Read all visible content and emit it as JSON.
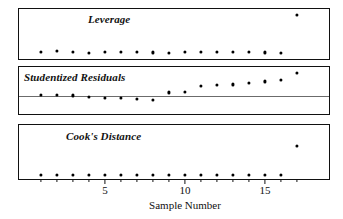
{
  "chart_data": {
    "type": "scatter",
    "title": "",
    "xlabel": "Sample Number",
    "ylabel": "",
    "xlim": [
      0.2,
      17.8
    ],
    "xticks": [
      5,
      10,
      15
    ],
    "xticklabels": [
      "5",
      "10",
      "15"
    ],
    "grid": false,
    "legend": "none",
    "panels": [
      {
        "label": "Leverage",
        "ylim": [
          0,
          1
        ],
        "zero_line": false,
        "x": [
          1,
          2,
          3,
          4,
          5,
          6,
          7,
          8,
          9,
          10,
          11,
          12,
          13,
          14,
          15,
          16,
          17
        ],
        "values": [
          0.1,
          0.11,
          0.09,
          0.07,
          0.09,
          0.09,
          0.09,
          0.08,
          0.07,
          0.1,
          0.1,
          0.1,
          0.1,
          0.09,
          0.08,
          0.07,
          0.93
        ]
      },
      {
        "label": "Studentized Residuals",
        "ylim": [
          -1,
          1
        ],
        "zero_line": true,
        "x": [
          1,
          2,
          3,
          4,
          5,
          6,
          7,
          8,
          9,
          10,
          11,
          12,
          13,
          14,
          15,
          16,
          17
        ],
        "values": [
          -0.22,
          -0.2,
          -0.24,
          -0.33,
          -0.38,
          -0.38,
          -0.4,
          -0.44,
          -0.09,
          -0.07,
          0.22,
          0.26,
          0.3,
          0.36,
          0.44,
          0.5,
          0.84
        ]
      },
      {
        "label": "Cook's Distance",
        "ylim": [
          0,
          1
        ],
        "zero_line": false,
        "x": [
          1,
          2,
          3,
          4,
          5,
          6,
          7,
          8,
          9,
          10,
          11,
          12,
          13,
          14,
          15,
          16,
          17
        ],
        "values": [
          0.02,
          0.02,
          0.02,
          0.02,
          0.02,
          0.02,
          0.02,
          0.02,
          0.02,
          0.02,
          0.02,
          0.02,
          0.02,
          0.02,
          0.02,
          0.02,
          0.62
        ]
      }
    ]
  },
  "axis": {
    "xlabel": "Sample Number",
    "tick_5": "5",
    "tick_10": "10",
    "tick_15": "15"
  },
  "panels": {
    "leverage_label": "Leverage",
    "studentized_label": "Studentized Residuals",
    "cooks_label": "Cook's Distance"
  },
  "colors": {
    "point": "#000000",
    "frame": "#111111",
    "zero_line": "#6b6b6b",
    "background": "#ffffff"
  }
}
